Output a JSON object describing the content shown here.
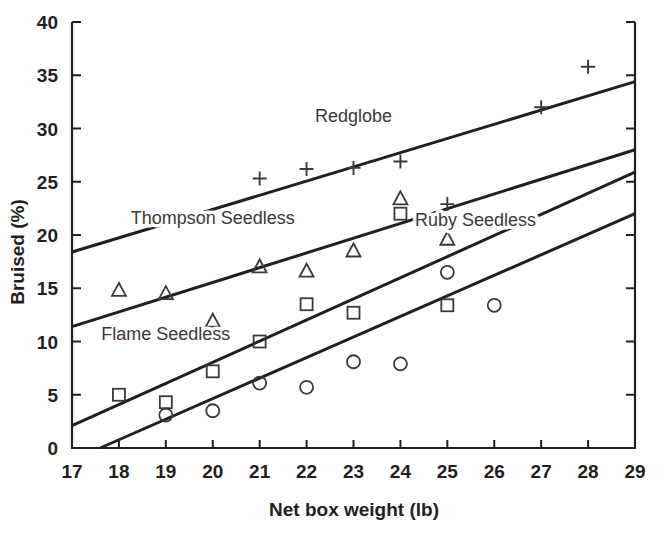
{
  "chart_data": {
    "type": "scatter",
    "title": "",
    "xlabel": "Net box weight (lb)",
    "ylabel": "Bruised (%)",
    "xlim": [
      17,
      29
    ],
    "ylim": [
      0,
      40
    ],
    "xticks": [
      17,
      18,
      19,
      20,
      21,
      22,
      23,
      24,
      25,
      26,
      27,
      28,
      29
    ],
    "yticks": [
      0,
      5,
      10,
      15,
      20,
      25,
      30,
      35,
      40
    ],
    "grid": false,
    "legend_position": "inline-annotations",
    "series": [
      {
        "name": "Redglobe",
        "marker": "plus",
        "label_x": 23.0,
        "label_y": 30.6,
        "points": [
          {
            "x": 21,
            "y": 25.3
          },
          {
            "x": 22,
            "y": 26.2
          },
          {
            "x": 23,
            "y": 26.3
          },
          {
            "x": 24,
            "y": 26.9
          },
          {
            "x": 25,
            "y": 22.9
          },
          {
            "x": 27,
            "y": 32.0
          },
          {
            "x": 28,
            "y": 35.8
          }
        ],
        "fit_line": {
          "x0": 17,
          "y0": 18.4,
          "x1": 29,
          "y1": 34.4
        }
      },
      {
        "name": "Flame Seedless",
        "marker": "triangle",
        "label_x": 19.0,
        "label_y": 10.1,
        "points": [
          {
            "x": 18,
            "y": 14.8
          },
          {
            "x": 19,
            "y": 14.5
          },
          {
            "x": 20,
            "y": 11.9
          },
          {
            "x": 21,
            "y": 17.0
          },
          {
            "x": 22,
            "y": 16.6
          },
          {
            "x": 23,
            "y": 18.5
          },
          {
            "x": 24,
            "y": 23.4
          },
          {
            "x": 25,
            "y": 19.6
          }
        ],
        "fit_line": {
          "x0": 17,
          "y0": 11.4,
          "x1": 29,
          "y1": 28.0
        }
      },
      {
        "name": "Thompson Seedless",
        "marker": "square",
        "label_x": 20.0,
        "label_y": 21.0,
        "points": [
          {
            "x": 18,
            "y": 5.0
          },
          {
            "x": 19,
            "y": 4.3
          },
          {
            "x": 20,
            "y": 7.2
          },
          {
            "x": 21,
            "y": 10.0
          },
          {
            "x": 22,
            "y": 13.5
          },
          {
            "x": 23,
            "y": 12.7
          },
          {
            "x": 24,
            "y": 22.0
          },
          {
            "x": 25,
            "y": 13.4
          }
        ],
        "fit_line": {
          "x0": 17,
          "y0": 2.1,
          "x1": 29,
          "y1": 25.9
        }
      },
      {
        "name": "Ruby Seedless",
        "marker": "circle",
        "label_x": 25.6,
        "label_y": 20.8,
        "points": [
          {
            "x": 19,
            "y": 3.1
          },
          {
            "x": 20,
            "y": 3.5
          },
          {
            "x": 21,
            "y": 6.1
          },
          {
            "x": 22,
            "y": 5.7
          },
          {
            "x": 23,
            "y": 8.1
          },
          {
            "x": 24,
            "y": 7.9
          },
          {
            "x": 25,
            "y": 16.5
          },
          {
            "x": 26,
            "y": 13.4
          }
        ],
        "fit_line": {
          "x0": 17.6,
          "y0": 0.0,
          "x1": 29,
          "y1": 22.0
        }
      }
    ]
  },
  "style": {
    "ink": "#231f20",
    "line_color": "#231f20",
    "marker_color": "#3a3a3a",
    "background": "#ffffff"
  }
}
